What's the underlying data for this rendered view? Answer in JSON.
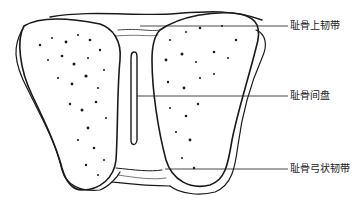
{
  "figure": {
    "labels": [
      {
        "text": "耻骨上韧带",
        "y": 26
      },
      {
        "text": "耻骨间盘",
        "y": 96
      },
      {
        "text": "耻骨弓状韧带",
        "y": 169
      }
    ],
    "colors": {
      "line": "#1a1a1a",
      "background": "#ffffff"
    }
  }
}
